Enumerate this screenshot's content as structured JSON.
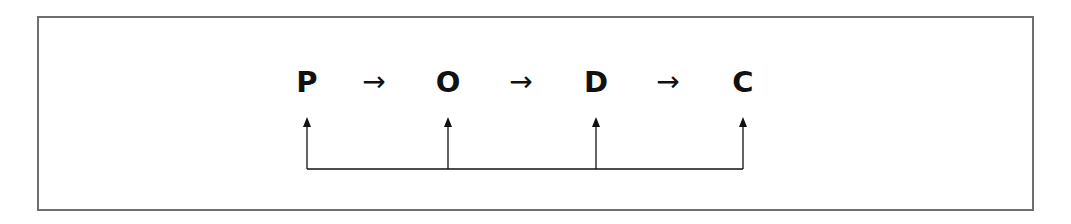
{
  "diagram": {
    "nodes": [
      {
        "label": "P",
        "x": 307
      },
      {
        "label": "O",
        "x": 448
      },
      {
        "label": "D",
        "x": 596
      },
      {
        "label": "C",
        "x": 743
      }
    ],
    "flow_arrows": [
      {
        "glyph": "→",
        "from": "P",
        "to": "O",
        "x": 374
      },
      {
        "glyph": "→",
        "from": "O",
        "to": "D",
        "x": 521
      },
      {
        "glyph": "→",
        "from": "D",
        "to": "C",
        "x": 668
      }
    ],
    "feedback_bus": {
      "description": "Common baseline connector with upward arrows into each node",
      "targets": [
        "P",
        "O",
        "D",
        "C"
      ],
      "color": "#111111"
    },
    "border_color": "#6e6e6e"
  }
}
